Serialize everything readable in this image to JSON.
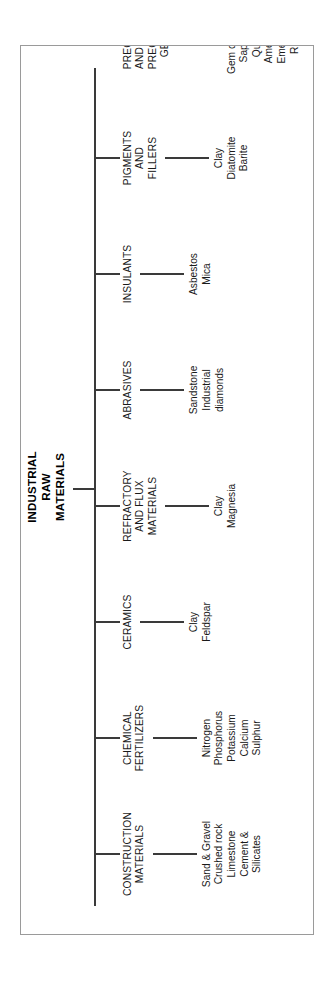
{
  "diagram": {
    "type": "hierarchy-tree",
    "orientation": "rotated-90-ccw",
    "root": {
      "label": "INDUSTRIAL RAW MATERIALS",
      "lines": [
        "INDUSTRIAL",
        "RAW",
        "MATERIALS"
      ]
    },
    "branches": [
      {
        "label": "CONSTRUCTION MATERIALS",
        "lines": [
          "CONSTRUCTION",
          "MATERIALS"
        ],
        "leaves": [
          "Sand & Gravel",
          "Crushed rock",
          "Limestone",
          "Cement &",
          "Silicates"
        ]
      },
      {
        "label": "CHEMICAL FERTILIZERS",
        "lines": [
          "CHEMICAL",
          "FERTILIZERS"
        ],
        "leaves": [
          "Nitrogen",
          "Phosphorus",
          "Potassium",
          "Calcium",
          "Sulphur"
        ]
      },
      {
        "label": "CERAMICS",
        "lines": [
          "CERAMICS"
        ],
        "leaves": [
          "Clay",
          "Feldspar"
        ]
      },
      {
        "label": "REFRACTORY AND FLUX MATERIALS",
        "lines": [
          "REFRACTORY",
          "AND FLUX",
          "MATERIALS"
        ],
        "leaves": [
          "Clay",
          "Magnesia"
        ]
      },
      {
        "label": "ABRASIVES",
        "lines": [
          "ABRASIVES"
        ],
        "leaves": [
          "Sandstone",
          "Industrial",
          "diamonds"
        ]
      },
      {
        "label": "INSULANTS",
        "lines": [
          "INSULANTS"
        ],
        "leaves": [
          "Asbestos",
          "Mica"
        ]
      },
      {
        "label": "PIGMENTS AND FILLERS",
        "lines": [
          "PIGMENTS",
          "AND",
          "FILLERS"
        ],
        "leaves": [
          "Clay",
          "Diatomite",
          "Barite"
        ]
      },
      {
        "label": "PRECIOUS AND SEMI-PRECIOUS GEMS",
        "lines": [
          "PRECIOUS",
          "AND SEMI-",
          "PRECIOUS",
          "GEMS"
        ],
        "leaves": [
          "Gem diamond",
          "Sapphire",
          "Quartz",
          "Amethyst",
          "Emeralds",
          "Ruby"
        ]
      }
    ],
    "colors": {
      "line": "#3a3a3a",
      "border": "#9a9a9a",
      "text": "#1a1a1a",
      "background": "#ffffff"
    }
  }
}
